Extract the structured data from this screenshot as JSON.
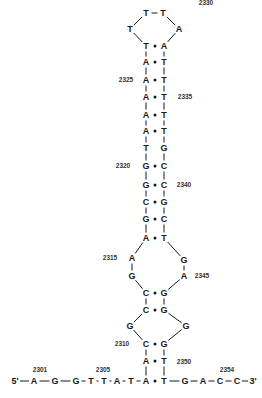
{
  "diagram": {
    "type": "nucleic-acid-secondary-structure",
    "strand_ends": {
      "five_prime": "5'",
      "three_prime": "3'"
    },
    "position_labels": [
      {
        "id": "l2301",
        "text": "2301",
        "x": 40,
        "y": 370
      },
      {
        "id": "l2305",
        "text": "2305",
        "x": 103,
        "y": 370
      },
      {
        "id": "l2310",
        "text": "2310",
        "x": 122,
        "y": 344
      },
      {
        "id": "l2315",
        "text": "2315",
        "x": 110,
        "y": 258
      },
      {
        "id": "l2320",
        "text": "2320",
        "x": 123,
        "y": 166
      },
      {
        "id": "l2325",
        "text": "2325",
        "x": 126,
        "y": 80
      },
      {
        "id": "l2330",
        "text": "2330",
        "x": 206,
        "y": 3
      },
      {
        "id": "l2335",
        "text": "2335",
        "x": 185,
        "y": 97
      },
      {
        "id": "l2340",
        "text": "2340",
        "x": 184,
        "y": 185
      },
      {
        "id": "l2345",
        "text": "2345",
        "x": 202,
        "y": 276
      },
      {
        "id": "l2350",
        "text": "2350",
        "x": 184,
        "y": 362
      },
      {
        "id": "l2354",
        "text": "2354",
        "x": 227,
        "y": 370
      }
    ],
    "nucleotides": [
      {
        "id": "n2301",
        "base": "A",
        "x": 34,
        "y": 381
      },
      {
        "id": "n2302",
        "base": "G",
        "x": 55,
        "y": 381
      },
      {
        "id": "n2303",
        "base": "G",
        "x": 76,
        "y": 381
      },
      {
        "id": "n2304",
        "base": "T",
        "x": 91,
        "y": 381
      },
      {
        "id": "n2305",
        "base": "T",
        "x": 104,
        "y": 381
      },
      {
        "id": "n2306",
        "base": "A",
        "x": 117,
        "y": 381
      },
      {
        "id": "n2307",
        "base": "T",
        "x": 131,
        "y": 381
      },
      {
        "id": "n2308",
        "base": "A",
        "x": 146,
        "y": 381
      },
      {
        "id": "n2309",
        "base": "A",
        "x": 146,
        "y": 361
      },
      {
        "id": "n2310",
        "base": "C",
        "x": 146,
        "y": 344
      },
      {
        "id": "n2311",
        "base": "G",
        "x": 130,
        "y": 326
      },
      {
        "id": "n2312",
        "base": "C",
        "x": 146,
        "y": 310
      },
      {
        "id": "n2313",
        "base": "C",
        "x": 146,
        "y": 293
      },
      {
        "id": "n2314",
        "base": "G",
        "x": 132,
        "y": 276
      },
      {
        "id": "n2315",
        "base": "A",
        "x": 132,
        "y": 258
      },
      {
        "id": "n2316",
        "base": "A",
        "x": 146,
        "y": 238
      },
      {
        "id": "n2317",
        "base": "G",
        "x": 146,
        "y": 219
      },
      {
        "id": "n2318",
        "base": "C",
        "x": 146,
        "y": 202
      },
      {
        "id": "n2319",
        "base": "G",
        "x": 146,
        "y": 185
      },
      {
        "id": "n2320",
        "base": "G",
        "x": 146,
        "y": 166
      },
      {
        "id": "n2321",
        "base": "T",
        "x": 146,
        "y": 148
      },
      {
        "id": "n2322",
        "base": "A",
        "x": 146,
        "y": 131
      },
      {
        "id": "n2323",
        "base": "A",
        "x": 146,
        "y": 115
      },
      {
        "id": "n2324",
        "base": "A",
        "x": 146,
        "y": 97
      },
      {
        "id": "n2325",
        "base": "A",
        "x": 146,
        "y": 80
      },
      {
        "id": "n2326",
        "base": "A",
        "x": 146,
        "y": 62
      },
      {
        "id": "n2327",
        "base": "T",
        "x": 146,
        "y": 46
      },
      {
        "id": "n2328",
        "base": "T",
        "x": 130,
        "y": 29
      },
      {
        "id": "n2329",
        "base": "T",
        "x": 146,
        "y": 13
      },
      {
        "id": "n2330",
        "base": "T",
        "x": 163,
        "y": 13
      },
      {
        "id": "n2331",
        "base": "A",
        "x": 179,
        "y": 29
      },
      {
        "id": "n2332",
        "base": "A",
        "x": 164,
        "y": 46
      },
      {
        "id": "n2333",
        "base": "T",
        "x": 164,
        "y": 62
      },
      {
        "id": "n2334",
        "base": "T",
        "x": 164,
        "y": 80
      },
      {
        "id": "n2335",
        "base": "T",
        "x": 164,
        "y": 97
      },
      {
        "id": "n2336",
        "base": "T",
        "x": 164,
        "y": 115
      },
      {
        "id": "n2337",
        "base": "T",
        "x": 164,
        "y": 131
      },
      {
        "id": "n2338",
        "base": "G",
        "x": 164,
        "y": 148
      },
      {
        "id": "n2339",
        "base": "C",
        "x": 164,
        "y": 166
      },
      {
        "id": "n2340",
        "base": "C",
        "x": 164,
        "y": 185
      },
      {
        "id": "n2341",
        "base": "G",
        "x": 164,
        "y": 202
      },
      {
        "id": "n2342",
        "base": "C",
        "x": 164,
        "y": 219
      },
      {
        "id": "n2343",
        "base": "T",
        "x": 164,
        "y": 238
      },
      {
        "id": "n2344",
        "base": "G",
        "x": 184,
        "y": 260
      },
      {
        "id": "n2345",
        "base": "A",
        "x": 184,
        "y": 276
      },
      {
        "id": "n2346",
        "base": "G",
        "x": 164,
        "y": 293
      },
      {
        "id": "n2347",
        "base": "G",
        "x": 164,
        "y": 310
      },
      {
        "id": "n2348",
        "base": "G",
        "x": 186,
        "y": 326
      },
      {
        "id": "n2349",
        "base": "G",
        "x": 164,
        "y": 344
      },
      {
        "id": "n2350",
        "base": "T",
        "x": 164,
        "y": 361
      },
      {
        "id": "n2351",
        "base": "T",
        "x": 164,
        "y": 381
      },
      {
        "id": "n2352",
        "base": "G",
        "x": 185,
        "y": 381
      },
      {
        "id": "n2353",
        "base": "A",
        "x": 203,
        "y": 381
      },
      {
        "id": "n2354",
        "base": "C",
        "x": 220,
        "y": 381
      },
      {
        "id": "n2355",
        "base": "C",
        "x": 237,
        "y": 381
      }
    ],
    "end_labels": [
      {
        "id": "e5",
        "text": "5'",
        "x": 15,
        "y": 381
      },
      {
        "id": "e3",
        "text": "3'",
        "x": 253,
        "y": 381
      }
    ],
    "base_pairs_y": [
      46,
      62,
      80,
      97,
      115,
      131,
      166,
      185,
      202,
      219,
      238,
      293,
      310,
      344,
      361,
      381
    ]
  }
}
